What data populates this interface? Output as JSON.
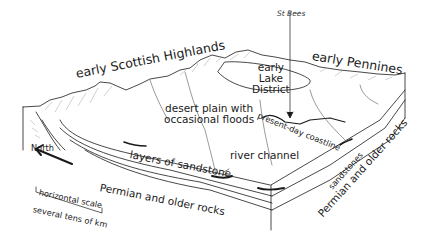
{
  "diagram": {
    "type": "geological block diagram",
    "labels": {
      "st_bees": "St Bees",
      "early_pennines": "early Pennines",
      "early_scottish_highlands": "early Scottish Highlands",
      "early_lake_district": [
        "early",
        "Lake",
        "District"
      ],
      "desert_plain": [
        "desert plain with",
        "occasional floods"
      ],
      "present_day_coastline": "present-day coastline",
      "north": "North",
      "layers_of_sandstone": "layers of sandstone",
      "river_channel": "river channel",
      "sandstones": "sandstones",
      "permian_front": "Permian and older rocks",
      "permian_side": "Permian and older rocks",
      "scale_title": "horizontal scale",
      "scale_value": "several tens of km"
    },
    "colors": {
      "line": "#1a1a1a",
      "hatch": "#8a8a8a",
      "background": "#ffffff"
    }
  }
}
